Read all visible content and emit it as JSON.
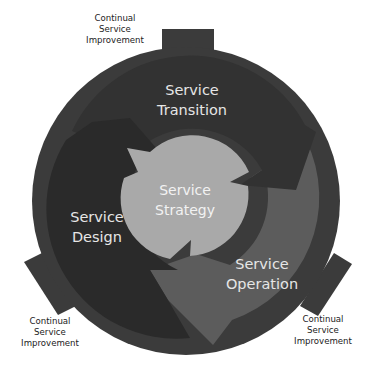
{
  "core": {
    "line1": "Service",
    "line2": "Strategy"
  },
  "stages": [
    {
      "id": "transition",
      "line1": "Service",
      "line2": "Transition"
    },
    {
      "id": "design",
      "line1": "Service",
      "line2": "Design"
    },
    {
      "id": "operation",
      "line1": "Service",
      "line2": "Operation"
    }
  ],
  "improvement_labels": [
    {
      "position": "top",
      "line1": "Continual",
      "line2": "Service",
      "line3": "Improvement"
    },
    {
      "position": "bottom-left",
      "line1": "Continual",
      "line2": "Service",
      "line3": "Improvement"
    },
    {
      "position": "bottom-right",
      "line1": "Continual",
      "line2": "Service",
      "line3": "Improvement"
    }
  ],
  "colors": {
    "outer_ring": "#3b3b3b",
    "transition_arrow": "#363636",
    "design_arrow": "#2b2b2b",
    "operation_arrow": "#5c5c5c",
    "core": "#a9a9a9",
    "background": "#ffffff"
  }
}
